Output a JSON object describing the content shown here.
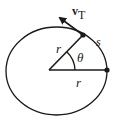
{
  "diagram": {
    "labels": {
      "velocity_symbol": "v",
      "velocity_subscript": "T",
      "radius_upper": "r",
      "radius_lower": "r",
      "angle": "θ",
      "arc_length": "s"
    },
    "colors": {
      "stroke": "#1a1a1a",
      "background": "#ffffff"
    }
  }
}
